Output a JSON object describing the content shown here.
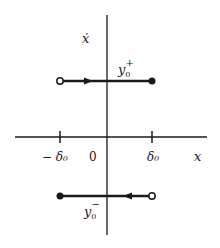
{
  "diagram": {
    "type": "phase-plane",
    "colors": {
      "ink": "#1a1a1a",
      "background": "#ffffff"
    },
    "axes": {
      "vertical_label": "ẋ",
      "horizontal_label": "x",
      "origin_label": "0"
    },
    "ticks": [
      {
        "label": "− δ₀",
        "position": "negative"
      },
      {
        "label": "δ₀",
        "position": "positive"
      }
    ],
    "trajectories": [
      {
        "label": "y₀⁺",
        "base": "y",
        "sub": "0",
        "sup": "+",
        "direction": "right",
        "start": "open-circle at −δ₀",
        "end": "filled-dot at δ₀"
      },
      {
        "label": "y₀⁻",
        "base": "y",
        "sub": "0",
        "sup": "−",
        "direction": "left",
        "start": "open-circle at δ₀",
        "end": "filled-dot at −δ₀"
      }
    ]
  }
}
